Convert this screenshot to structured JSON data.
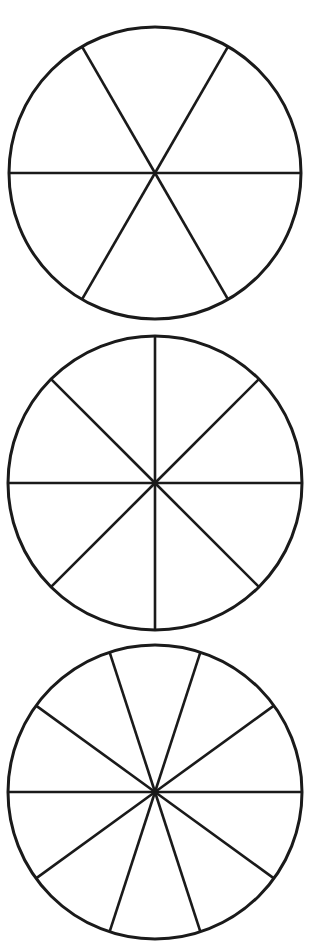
{
  "diagram": {
    "title": "",
    "stroke_color": "#1a1a1a",
    "background_color": "#ffffff",
    "circles": [
      {
        "id": "circle-6-sections",
        "sections": 6,
        "cx": 155,
        "cy": 173,
        "r": 146,
        "start_angle_deg": 0
      },
      {
        "id": "circle-8-sections",
        "sections": 8,
        "cx": 155,
        "cy": 483,
        "r": 147,
        "start_angle_deg": 0
      },
      {
        "id": "circle-10-sections",
        "sections": 10,
        "cx": 155,
        "cy": 792,
        "r": 147,
        "start_angle_deg": 0
      }
    ]
  }
}
